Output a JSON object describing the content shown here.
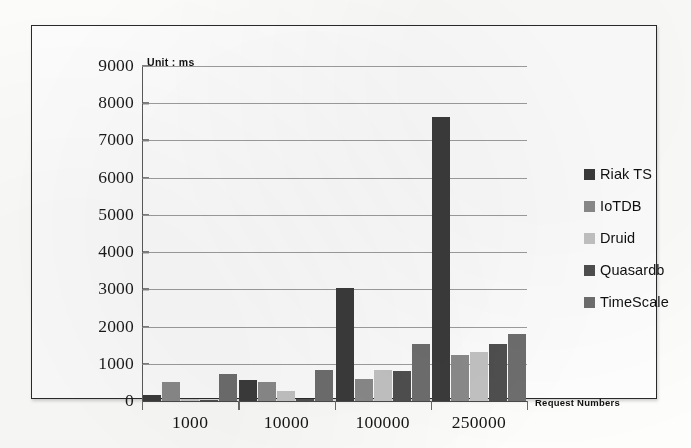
{
  "chart_data": {
    "type": "bar",
    "title": "",
    "unit_note": "Unit : ms",
    "xlabel": "Request Numbers",
    "ylabel": "",
    "categories": [
      "1000",
      "10000",
      "100000",
      "250000"
    ],
    "ylim": [
      0,
      9000
    ],
    "yticks": [
      9000,
      8000,
      7000,
      6000,
      5000,
      4000,
      3000,
      2000,
      1000,
      0
    ],
    "grid": true,
    "legend_position": "right",
    "series": [
      {
        "name": "Riak TS",
        "color": "#3b3b3b",
        "values": [
          150,
          570,
          3030,
          7620
        ]
      },
      {
        "name": "IoTDB",
        "color": "#8a8a8a",
        "values": [
          500,
          520,
          600,
          1230
        ]
      },
      {
        "name": "Druid",
        "color": "#c3c3c3",
        "values": [
          50,
          270,
          820,
          1320
        ]
      },
      {
        "name": "Quasardb",
        "color": "#4f4f4f",
        "values": [
          10,
          60,
          800,
          1520
        ]
      },
      {
        "name": "TimeScale",
        "color": "#6e6e6e",
        "values": [
          730,
          830,
          1520,
          1790
        ]
      }
    ]
  },
  "legend": {
    "items": [
      {
        "label": "Riak TS",
        "swatch": "legend-swatch-riak-ts"
      },
      {
        "label": "IoTDB",
        "swatch": "legend-swatch-iotdb"
      },
      {
        "label": "Druid",
        "swatch": "legend-swatch-druid"
      },
      {
        "label": "Quasardb",
        "swatch": "legend-swatch-quasardb"
      },
      {
        "label": "TimeScale",
        "swatch": "legend-swatch-timescale"
      }
    ]
  }
}
